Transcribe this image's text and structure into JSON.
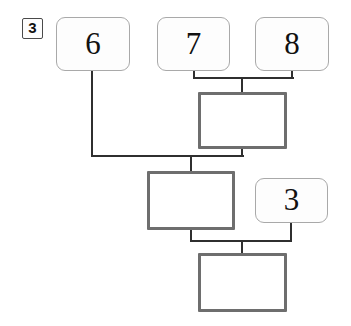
{
  "diagram": {
    "type": "node-link-tree",
    "colors": {
      "background": "#ffffff",
      "value_node_border": "#a9a9a9",
      "value_node_fill": "#fdfdfd",
      "operator_node_border": "#6e6e6e",
      "operator_node_fill": "#ffffff",
      "badge_border": "#4a4a4a",
      "connector": "#2f2f2f",
      "text": "#111111"
    },
    "badge": {
      "label": "3"
    },
    "value_nodes": [
      {
        "id": "v6",
        "label": "6"
      },
      {
        "id": "v7",
        "label": "7"
      },
      {
        "id": "v8",
        "label": "8"
      },
      {
        "id": "v3",
        "label": "3"
      }
    ],
    "operator_nodes": [
      {
        "id": "op1",
        "label": ""
      },
      {
        "id": "op2",
        "label": ""
      },
      {
        "id": "op3",
        "label": ""
      }
    ],
    "edges": [
      {
        "from": "v7",
        "to": "op1"
      },
      {
        "from": "v8",
        "to": "op1"
      },
      {
        "from": "v6",
        "to": "op2"
      },
      {
        "from": "op1",
        "to": "op2"
      },
      {
        "from": "op2",
        "to": "op3"
      },
      {
        "from": "v3",
        "to": "op3"
      }
    ]
  }
}
